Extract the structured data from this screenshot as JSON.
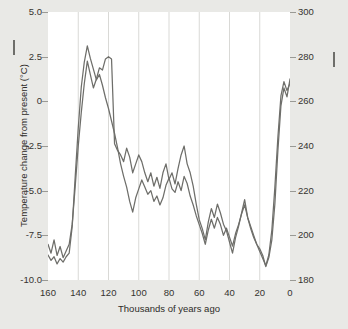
{
  "figure": {
    "background_color": "#e9e9e6",
    "plot_background_color": "#ffffff",
    "gridline_color": "#d9d9d6",
    "line_color": "#6e6e6a"
  },
  "axes": {
    "left_title": "Temperature change from present (°C)",
    "right_title": "Carbon dioxide concentration (ppm)",
    "bottom_title": "Thousands of years ago",
    "left_ticks": [
      "5.0",
      "2.5",
      "0",
      "-2.5",
      "-5.0",
      "-7.5",
      "-10.0"
    ],
    "right_ticks": [
      "300",
      "280",
      "260",
      "240",
      "220",
      "200",
      "180"
    ],
    "bottom_ticks": [
      "160",
      "140",
      "120",
      "100",
      "80",
      "60",
      "40",
      "20",
      "0"
    ]
  },
  "legend": {
    "temperature_marker": "line-dash-icon",
    "co2_marker": "line-dash-icon"
  },
  "chart_data": {
    "type": "line",
    "title": "",
    "xlabel": "Thousands of years ago",
    "ylabel": "Temperature change from present (°C)",
    "y2label": "Carbon dioxide concentration (ppm)",
    "xlim": [
      160,
      0
    ],
    "xlim_reversed": true,
    "ylim": [
      -10.0,
      5.0
    ],
    "y2lim": [
      180,
      300
    ],
    "grid": "vertical-only",
    "legend_position": "axis-titles",
    "yticks": [
      5.0,
      2.5,
      0,
      -2.5,
      -5.0,
      -7.5,
      -10.0
    ],
    "y2ticks": [
      300,
      280,
      260,
      240,
      220,
      200,
      180
    ],
    "xticks": [
      160,
      140,
      120,
      100,
      80,
      60,
      40,
      20,
      0
    ],
    "series": [
      {
        "name": "Temperature change from present (°C)",
        "axis": "left",
        "units": "°C",
        "color": "#6e6e6a",
        "x": [
          160,
          158,
          156,
          154,
          152,
          150,
          148,
          146,
          144,
          142,
          140,
          138,
          136,
          134,
          132,
          130,
          128,
          126,
          124,
          122,
          120,
          118,
          116,
          114,
          112,
          110,
          108,
          106,
          104,
          102,
          100,
          98,
          96,
          94,
          92,
          90,
          88,
          86,
          84,
          82,
          80,
          78,
          76,
          74,
          72,
          70,
          68,
          66,
          64,
          62,
          60,
          58,
          56,
          54,
          52,
          50,
          48,
          46,
          44,
          42,
          40,
          38,
          36,
          34,
          32,
          30,
          28,
          26,
          24,
          22,
          20,
          18,
          16,
          14,
          12,
          10,
          8,
          6,
          4,
          2,
          0
        ],
        "values": [
          -8.6,
          -8.9,
          -8.7,
          -9.1,
          -8.8,
          -9.0,
          -8.7,
          -8.5,
          -7.0,
          -4.2,
          -1.5,
          0.8,
          2.2,
          3.1,
          2.4,
          1.8,
          1.2,
          1.5,
          0.9,
          0.2,
          -0.4,
          -1.1,
          -1.8,
          -2.6,
          -3.5,
          -4.2,
          -4.8,
          -5.6,
          -6.2,
          -5.4,
          -4.9,
          -4.4,
          -4.8,
          -5.2,
          -5.0,
          -5.6,
          -5.3,
          -5.8,
          -5.4,
          -4.7,
          -4.3,
          -4.9,
          -5.1,
          -4.5,
          -5.0,
          -4.2,
          -4.6,
          -5.3,
          -5.8,
          -6.4,
          -6.9,
          -7.4,
          -8.0,
          -7.2,
          -6.6,
          -7.1,
          -6.5,
          -6.9,
          -7.5,
          -7.1,
          -7.6,
          -8.1,
          -7.4,
          -6.9,
          -6.3,
          -5.8,
          -6.5,
          -7.0,
          -7.5,
          -8.0,
          -8.4,
          -8.8,
          -9.2,
          -8.6,
          -7.2,
          -4.8,
          -2.0,
          0.3,
          1.1,
          0.6,
          1.0
        ],
        "notes": "Cold glacial ~-9 °C at 160-150 ka, sharp deglacial warming to peak ~+4.3 °C near 133 ka (Eemian), long cooling trend through the last glacial with millennial oscillations, minimum ~-9.5 °C near 18 ka, then abrupt Holocene warming to ~+1 °C at present."
      },
      {
        "name": "Carbon dioxide concentration (ppm)",
        "axis": "right",
        "units": "ppm",
        "color": "#6e6e6a",
        "x": [
          160,
          158,
          156,
          154,
          152,
          150,
          148,
          146,
          144,
          142,
          140,
          138,
          136,
          134,
          132,
          130,
          128,
          126,
          124,
          122,
          120,
          118,
          116,
          114,
          112,
          110,
          108,
          106,
          104,
          102,
          100,
          98,
          96,
          94,
          92,
          90,
          88,
          86,
          84,
          82,
          80,
          78,
          76,
          74,
          72,
          70,
          68,
          66,
          64,
          62,
          60,
          58,
          56,
          54,
          52,
          50,
          48,
          46,
          44,
          42,
          40,
          38,
          36,
          34,
          32,
          30,
          28,
          26,
          24,
          22,
          20,
          18,
          16,
          14,
          12,
          10,
          8,
          6,
          4,
          2,
          0
        ],
        "values": [
          196,
          192,
          198,
          191,
          195,
          190,
          193,
          196,
          205,
          222,
          240,
          255,
          268,
          278,
          272,
          266,
          270,
          275,
          274,
          279,
          280,
          279,
          241,
          238,
          236,
          233,
          239,
          235,
          228,
          232,
          236,
          233,
          228,
          224,
          228,
          222,
          226,
          221,
          228,
          232,
          225,
          228,
          223,
          230,
          236,
          240,
          232,
          228,
          222,
          214,
          207,
          203,
          198,
          206,
          212,
          208,
          214,
          210,
          205,
          202,
          197,
          192,
          199,
          204,
          210,
          216,
          208,
          203,
          199,
          196,
          194,
          191,
          186,
          190,
          198,
          214,
          238,
          258,
          266,
          262,
          270
        ],
        "notes": "CO2 tracks temperature: ~190-200 ppm during glacials, rising to ~280 ppm in the last interglacial (~125 ka), falling through the glacial with millennial wiggles to ~185-190 ppm at the Last Glacial Maximum, then rising to ~270 ppm in the Holocene."
      }
    ]
  }
}
